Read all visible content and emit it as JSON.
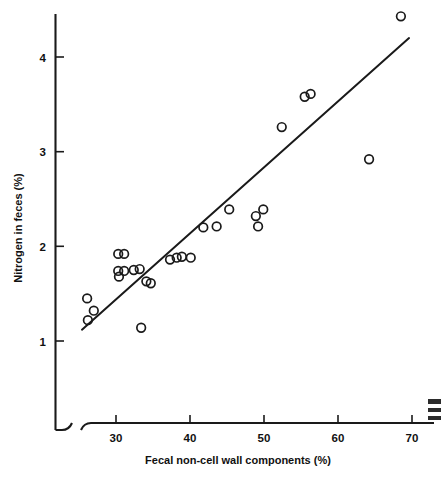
{
  "chart_data": {
    "type": "scatter",
    "title": "",
    "subtitle": "",
    "xlabel": "Fecal non-cell wall components (%)",
    "ylabel": "Nitrogen in feces (%)",
    "xlim": [
      24.5,
      70.5
    ],
    "ylim": [
      0.75,
      4.62
    ],
    "xticks": [
      30,
      40,
      50,
      60,
      70
    ],
    "xticklabels": [
      "30",
      "40",
      "50",
      "60",
      "70"
    ],
    "yticks": [
      1,
      2,
      3,
      4
    ],
    "yticklabels": [
      "1",
      "2",
      "3",
      "4"
    ],
    "grid": false,
    "legend": false,
    "axis_break_x": true,
    "points": [
      {
        "x": 26.1,
        "y": 1.45
      },
      {
        "x": 27.0,
        "y": 1.32
      },
      {
        "x": 26.2,
        "y": 1.22
      },
      {
        "x": 30.3,
        "y": 1.92
      },
      {
        "x": 31.1,
        "y": 1.92
      },
      {
        "x": 30.3,
        "y": 1.74
      },
      {
        "x": 31.1,
        "y": 1.74
      },
      {
        "x": 30.4,
        "y": 1.68
      },
      {
        "x": 32.4,
        "y": 1.75
      },
      {
        "x": 33.2,
        "y": 1.76
      },
      {
        "x": 34.1,
        "y": 1.63
      },
      {
        "x": 34.7,
        "y": 1.61
      },
      {
        "x": 33.4,
        "y": 1.14
      },
      {
        "x": 37.3,
        "y": 1.86
      },
      {
        "x": 38.2,
        "y": 1.88
      },
      {
        "x": 38.9,
        "y": 1.89
      },
      {
        "x": 40.1,
        "y": 1.88
      },
      {
        "x": 41.8,
        "y": 2.2
      },
      {
        "x": 43.6,
        "y": 2.21
      },
      {
        "x": 45.3,
        "y": 2.39
      },
      {
        "x": 48.9,
        "y": 2.32
      },
      {
        "x": 49.2,
        "y": 2.21
      },
      {
        "x": 49.9,
        "y": 2.39
      },
      {
        "x": 52.4,
        "y": 3.26
      },
      {
        "x": 55.5,
        "y": 3.58
      },
      {
        "x": 56.3,
        "y": 3.61
      },
      {
        "x": 64.2,
        "y": 2.92
      },
      {
        "x": 68.5,
        "y": 4.43
      }
    ],
    "fit_line": {
      "label": "regression line",
      "x_start": 25.4,
      "y_start": 1.12,
      "x_end": 69.6,
      "y_end": 4.2
    },
    "marker": {
      "shape": "open-circle",
      "radius_px": 4.3,
      "stroke_color": "#1a1a1a",
      "fill": "none"
    },
    "colors": {
      "axis": "#1a1a1a",
      "text": "#111111",
      "background": "#ffffff"
    }
  }
}
